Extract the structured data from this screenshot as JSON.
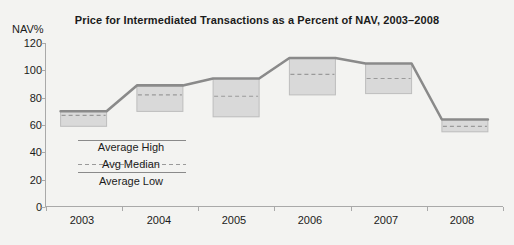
{
  "chart_data": {
    "type": "bar",
    "title": "Price for Intermediated Transactions as a Percent of NAV, 2003–2008",
    "xlabel": "",
    "ylabel": "NAV%",
    "ylim": [
      0,
      120
    ],
    "yticks": [
      0,
      20,
      40,
      60,
      80,
      100,
      120
    ],
    "categories": [
      "2003",
      "2004",
      "2005",
      "2006",
      "2007",
      "2008"
    ],
    "grid": false,
    "legend_position": "inside-lower-left",
    "series": [
      {
        "name": "Average High",
        "values": [
          70,
          89,
          94,
          109,
          105,
          64
        ]
      },
      {
        "name": "Avg Median",
        "values": [
          67,
          82,
          81,
          97,
          94,
          59
        ]
      },
      {
        "name": "Average Low",
        "values": [
          59,
          70,
          66,
          82,
          83,
          55
        ]
      }
    ]
  },
  "axis": {
    "y_unit": "NAV%",
    "y_tick_labels": [
      "120",
      "100",
      "80",
      "60",
      "40",
      "20",
      "0"
    ],
    "x_tick_labels": [
      "2003",
      "2004",
      "2005",
      "2006",
      "2007",
      "2008"
    ]
  },
  "legend": {
    "high_label": "Average High",
    "median_label": "Avg Median",
    "low_label": "Average Low"
  },
  "colors": {
    "background": "#f3f3f1",
    "box_fill": "#d9d9d9",
    "box_edge": "#bdbdbd",
    "line": "#8a8a8a",
    "median_dash": "#9a9a9a",
    "axis": "#a9a9a9",
    "text": "#1b1b1b"
  }
}
